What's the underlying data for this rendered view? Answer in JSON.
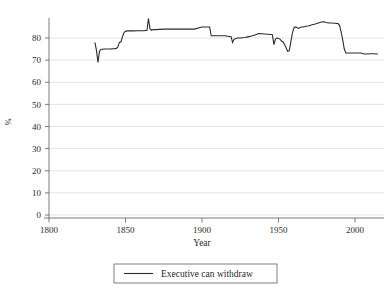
{
  "chart_data": {
    "type": "line",
    "title": "",
    "subtitle": "",
    "xlabel": "Year",
    "ylabel": "%",
    "xlim": [
      1790,
      2018
    ],
    "ylim": [
      0,
      90
    ],
    "xticks": [
      1800,
      1850,
      1900,
      1950,
      2000
    ],
    "xtick_labels": [
      "1800",
      "1850",
      "1900",
      "1950",
      "2000"
    ],
    "yticks": [
      0,
      10,
      20,
      30,
      40,
      50,
      60,
      70,
      80
    ],
    "ytick_labels": [
      "0",
      "10",
      "20",
      "30",
      "40",
      "50",
      "60",
      "70",
      "80"
    ],
    "grid": "horizontal",
    "grid_color": "#d9d9d9",
    "line_color": "#2b2b2b",
    "legend_position": "bottom-center",
    "legend": [
      "Executive can withdraw"
    ],
    "series": [
      {
        "name": "Executive can withdraw",
        "x": [
          1830,
          1831,
          1832,
          1833,
          1834,
          1836,
          1840,
          1843,
          1844,
          1845,
          1846,
          1847,
          1848,
          1849,
          1850,
          1851,
          1855,
          1858,
          1860,
          1862,
          1863,
          1864,
          1865,
          1866,
          1867,
          1868,
          1870,
          1872,
          1875,
          1878,
          1880,
          1885,
          1888,
          1890,
          1895,
          1900,
          1903,
          1905,
          1906,
          1908,
          1910,
          1912,
          1915,
          1917,
          1919,
          1920,
          1921,
          1923,
          1925,
          1928,
          1930,
          1933,
          1935,
          1937,
          1939,
          1941,
          1943,
          1945,
          1946,
          1947,
          1948,
          1949,
          1950,
          1951,
          1952,
          1953,
          1954,
          1955,
          1956,
          1957,
          1958,
          1959,
          1960,
          1961,
          1962,
          1963,
          1964,
          1965,
          1966,
          1968,
          1970,
          1972,
          1974,
          1976,
          1978,
          1980,
          1981,
          1983,
          1985,
          1987,
          1989,
          1990,
          1991,
          1992,
          1993,
          1994,
          1996,
          2000,
          2004,
          2006,
          2008,
          2010,
          2012,
          2015
        ],
        "y": [
          78.0,
          74.5,
          69.0,
          74.0,
          74.8,
          75.0,
          75.0,
          75.2,
          75.3,
          76.0,
          78.0,
          78.2,
          80.5,
          82.5,
          83.0,
          83.2,
          83.2,
          83.3,
          83.3,
          83.3,
          83.4,
          83.4,
          88.8,
          84.2,
          83.5,
          83.8,
          83.8,
          83.9,
          84.0,
          84.0,
          84.0,
          84.0,
          84.0,
          84.0,
          84.0,
          85.0,
          85.0,
          85.0,
          81.0,
          81.0,
          81.0,
          81.0,
          81.0,
          80.8,
          80.6,
          78.0,
          79.5,
          80.0,
          80.0,
          80.2,
          80.5,
          81.0,
          81.5,
          82.0,
          81.9,
          81.8,
          81.7,
          81.6,
          81.5,
          77.0,
          79.5,
          80.0,
          79.8,
          79.5,
          78.6,
          78.2,
          77.0,
          75.5,
          74.0,
          74.2,
          78.0,
          82.0,
          84.5,
          85.0,
          84.8,
          84.3,
          84.6,
          85.0,
          85.0,
          85.3,
          85.5,
          86.0,
          86.3,
          86.8,
          87.2,
          87.3,
          87.0,
          86.8,
          86.8,
          86.7,
          86.5,
          85.5,
          82.5,
          79.0,
          75.0,
          73.2,
          73.2,
          73.2,
          73.2,
          72.8,
          72.8,
          72.9,
          72.9,
          72.8
        ]
      }
    ]
  },
  "axis": {
    "x_title": "Year",
    "y_title": "%"
  },
  "legend": {
    "entries": [
      {
        "label": "Executive can withdraw",
        "marker": "line-swatch"
      }
    ]
  }
}
